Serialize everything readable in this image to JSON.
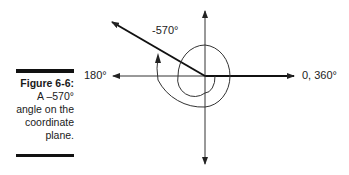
{
  "caption": {
    "figure_label": "Figure 6-6:",
    "lines": [
      "A –570°",
      "angle on the",
      "coordinate",
      "plane."
    ]
  },
  "diagram": {
    "angle_label": "-570°",
    "left_axis_label": "180°",
    "right_axis_label": "0, 360°",
    "angle_degrees": -570
  }
}
